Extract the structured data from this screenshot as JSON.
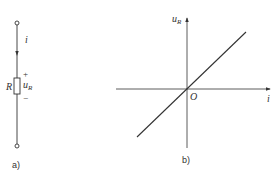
{
  "figure_a": {
    "caption": "a)",
    "current_label": "i",
    "resistor_label": "R",
    "voltage_label_main": "u",
    "voltage_label_sub": "R",
    "plus_sign": "+",
    "minus_sign": "−"
  },
  "figure_b": {
    "caption": "b)",
    "y_axis_label_main": "u",
    "y_axis_label_sub": "R",
    "x_axis_label": "i",
    "origin_label": "O"
  },
  "colors": {
    "stroke": "#333333",
    "background": "#ffffff"
  }
}
